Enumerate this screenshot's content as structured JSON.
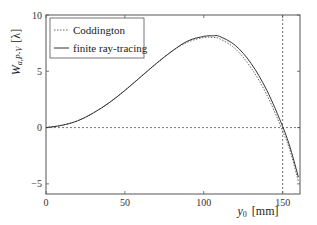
{
  "chart_data": {
    "type": "line",
    "title": "",
    "xlabel": "y_0 [mm]",
    "ylabel": "W_{a,P-V} [λ]",
    "xlim": [
      0,
      161
    ],
    "ylim": [
      -5.9,
      10
    ],
    "xticks": [
      0,
      50,
      100,
      150
    ],
    "yticks": [
      -5,
      0,
      5,
      10
    ],
    "grid": false,
    "legend_position": "upper left",
    "reference_lines": [
      {
        "orientation": "horizontal",
        "value": 0,
        "style": "dashed"
      },
      {
        "orientation": "vertical",
        "value": 150,
        "style": "dashed"
      }
    ],
    "series": [
      {
        "name": "Coddington",
        "style": "dotted",
        "x": [
          0,
          10,
          20,
          30,
          40,
          50,
          60,
          70,
          80,
          90,
          100,
          106,
          110,
          120,
          130,
          140,
          150,
          155,
          160
        ],
        "y": [
          0,
          0.2,
          0.6,
          1.3,
          2.2,
          3.3,
          4.5,
          5.7,
          6.8,
          7.6,
          8.0,
          8.0,
          7.9,
          7.0,
          5.3,
          2.9,
          -0.3,
          -2.2,
          -4.8
        ]
      },
      {
        "name": "finite ray-tracing",
        "style": "solid",
        "x": [
          0,
          10,
          20,
          30,
          40,
          50,
          60,
          70,
          80,
          90,
          100,
          106,
          110,
          120,
          130,
          140,
          150,
          155,
          160
        ],
        "y": [
          0,
          0.2,
          0.6,
          1.3,
          2.2,
          3.3,
          4.5,
          5.7,
          6.8,
          7.7,
          8.1,
          8.15,
          8.1,
          7.3,
          5.7,
          3.3,
          0.1,
          -1.9,
          -4.4
        ]
      }
    ]
  },
  "axes": {
    "x_tick_labels": [
      "0",
      "50",
      "100",
      "150"
    ],
    "y_tick_labels": [
      "-5",
      "0",
      "5",
      "10"
    ],
    "x_label_var": "y",
    "x_label_sub": "0",
    "x_label_unit": "[mm]",
    "y_label_var": "W",
    "y_label_sub": "a,P-V",
    "y_label_unit": "[λ]"
  },
  "legend": {
    "items": [
      "Coddington",
      "finite ray-tracing"
    ]
  }
}
